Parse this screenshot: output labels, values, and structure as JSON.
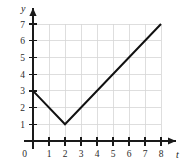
{
  "chart_data": {
    "type": "line",
    "title": "",
    "subtitle": "",
    "xlabel": "t",
    "ylabel": "y",
    "xlim": [
      0,
      8
    ],
    "ylim": [
      0,
      7
    ],
    "grid": true,
    "legend": null,
    "x_ticks": [
      0,
      1,
      2,
      3,
      4,
      5,
      6,
      7,
      8
    ],
    "x_ticklabels": [
      "0",
      "1",
      "2",
      "3",
      "4",
      "5",
      "6",
      "7",
      "8"
    ],
    "y_ticks": [
      0,
      1,
      2,
      3,
      4,
      5,
      6,
      7
    ],
    "y_ticklabels": [
      "0",
      "1",
      "2",
      "3",
      "4",
      "5",
      "6",
      "7"
    ],
    "origin_label": "0",
    "series": [
      {
        "name": "piecewise-linear",
        "color": "#111111",
        "x": [
          0,
          2,
          8
        ],
        "y": [
          3,
          1,
          7
        ]
      }
    ],
    "annotations": [],
    "axis_arrows": [
      "x-positive",
      "y-positive"
    ]
  },
  "colors": {
    "grid": "#d6d6d6",
    "axis": "#1a1a1a",
    "curve": "#111111",
    "background": "#ffffff",
    "tick_text": "#2b2b2b"
  }
}
